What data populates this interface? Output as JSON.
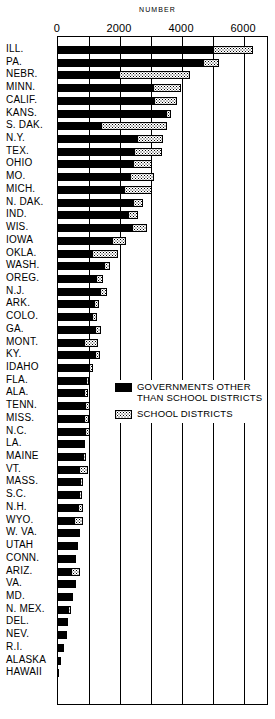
{
  "chart_data": {
    "type": "bar",
    "orientation": "horizontal",
    "stacked": true,
    "title": "NUMBER",
    "xlabel": "NUMBER",
    "ylabel": "",
    "xlim": [
      0,
      6800
    ],
    "xticks": [
      0,
      2000,
      4000,
      6000
    ],
    "xtick_labels": [
      "0",
      "2000",
      "4000",
      "6000"
    ],
    "grid": true,
    "grid_axis": "x",
    "grid_interval": 1000,
    "legend_position": "center-right",
    "categories": [
      "ILL.",
      "PA.",
      "NEBR.",
      "MINN.",
      "CALIF.",
      "KANS.",
      "S. DAK.",
      "N.Y.",
      "TEX.",
      "OHIO",
      "MO.",
      "MICH.",
      "N. DAK.",
      "IND.",
      "WIS.",
      "IOWA",
      "OKLA.",
      "WASH.",
      "OREG.",
      "N.J.",
      "ARK.",
      "COLO.",
      "GA.",
      "MONT.",
      "KY.",
      "IDAHO",
      "FLA.",
      "ALA.",
      "TENN.",
      "MISS.",
      "N.C.",
      "LA.",
      "MAINE",
      "VT.",
      "MASS.",
      "S.C.",
      "N.H.",
      "WYO.",
      "W. VA.",
      "UTAH",
      "CONN.",
      "ARIZ.",
      "VA.",
      "MD.",
      "N. MEX.",
      "DEL.",
      "NEV.",
      "R.I.",
      "ALASKA",
      "HAWAII"
    ],
    "series": [
      {
        "name": "GOVERNMENTS OTHER THAN SCHOOL DISTRICTS",
        "color": "#000000",
        "pattern": "solid",
        "values": [
          5010,
          4670,
          1950,
          3050,
          3100,
          3490,
          1380,
          2560,
          2440,
          2410,
          2330,
          2120,
          2430,
          2240,
          2400,
          1730,
          1100,
          1480,
          1240,
          1350,
          1150,
          1080,
          1200,
          830,
          1180,
          1000,
          900,
          850,
          880,
          840,
          870,
          800,
          800,
          680,
          710,
          670,
          630,
          520,
          640,
          590,
          570,
          420,
          530,
          420,
          330,
          250,
          220,
          140,
          90,
          20
        ]
      },
      {
        "name": "SCHOOL DISTRICTS",
        "color": "#ffffff",
        "pattern": "stipple",
        "values": [
          1280,
          520,
          2300,
          930,
          750,
          160,
          2120,
          820,
          900,
          630,
          770,
          900,
          300,
          350,
          470,
          470,
          820,
          210,
          200,
          230,
          180,
          180,
          190,
          470,
          180,
          120,
          100,
          130,
          150,
          160,
          150,
          70,
          90,
          300,
          90,
          95,
          170,
          290,
          60,
          40,
          0,
          280,
          20,
          30,
          90,
          20,
          20,
          40,
          0,
          0
        ]
      }
    ]
  },
  "legend": {
    "items": [
      {
        "label": "GOVERNMENTS OTHER\nTHAN SCHOOL DISTRICTS",
        "swatch": "solid-black"
      },
      {
        "label": "SCHOOL DISTRICTS",
        "swatch": "stippled"
      }
    ]
  }
}
